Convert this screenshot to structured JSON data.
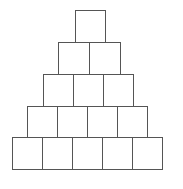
{
  "diagram": {
    "type": "number-pyramid",
    "line_color": "#555555",
    "background": "#ffffff",
    "rows": [
      {
        "cells": [
          ""
        ]
      },
      {
        "cells": [
          "",
          ""
        ]
      },
      {
        "cells": [
          "",
          "",
          ""
        ]
      },
      {
        "cells": [
          "",
          "",
          "",
          ""
        ]
      },
      {
        "cells": [
          "",
          "",
          "",
          "",
          ""
        ]
      }
    ]
  }
}
